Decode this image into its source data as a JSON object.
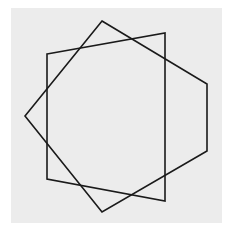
{
  "figure": {
    "background_color": "#ececec",
    "stroke_color": "#1a1a1a",
    "shapes": [
      {
        "name": "square",
        "points": [
          [
            47,
            54
          ],
          [
            165,
            33
          ],
          [
            165,
            201
          ],
          [
            47,
            179
          ]
        ]
      },
      {
        "name": "pentagon",
        "points": [
          [
            102,
            21
          ],
          [
            207,
            84
          ],
          [
            207,
            151
          ],
          [
            102,
            212
          ],
          [
            25,
            116
          ]
        ]
      }
    ]
  }
}
